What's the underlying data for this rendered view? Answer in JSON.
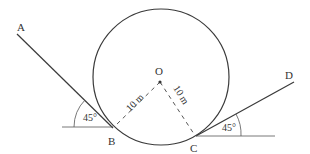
{
  "diagram": {
    "type": "geometry",
    "colors": {
      "line": "#3a3a3a",
      "dash": "#555555",
      "text": "#333333",
      "background": "#ffffff"
    },
    "circle": {
      "center_label": "O",
      "cx": 161,
      "cy": 77,
      "r": 68
    },
    "points": {
      "A": {
        "label": "A",
        "x": 17,
        "y": 34
      },
      "B": {
        "label": "B",
        "x": 113,
        "y": 128
      },
      "C": {
        "label": "C",
        "x": 196,
        "y": 136
      },
      "D": {
        "label": "D",
        "x": 294,
        "y": 82
      }
    },
    "radius_labels": {
      "OB": "10 m",
      "OC": "10 m"
    },
    "angles": {
      "at_B": "45°",
      "at_C": "45°"
    }
  }
}
